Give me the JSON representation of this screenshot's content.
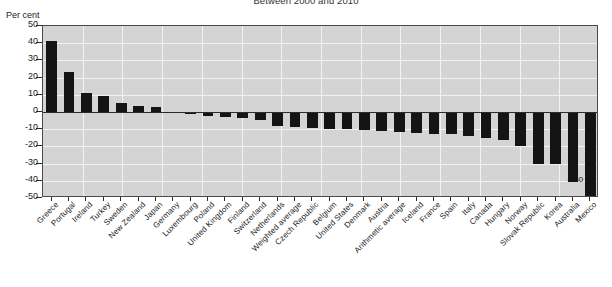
{
  "chart_data": {
    "type": "bar",
    "title": "Between 2000 and 2010",
    "xlabel": "",
    "ylabel": "Per cent",
    "ylim": [
      -50,
      50
    ],
    "yticks": [
      50,
      40,
      30,
      20,
      10,
      0,
      -10,
      -20,
      -30,
      -40,
      -50
    ],
    "ytick_labels": [
      "50",
      "40",
      "30",
      "20",
      "10",
      "0",
      "-10",
      "-20",
      "-30",
      "-40",
      "-50"
    ],
    "grid": true,
    "legend": "none",
    "categories": [
      "Greece",
      "Portugal",
      "Ireland",
      "Turkey",
      "Sweden",
      "New Zealand",
      "Japan",
      "Germany",
      "Luxembourg",
      "Poland",
      "United Kingdom",
      "Finland",
      "Switzerland",
      "Netherlands",
      "Weighted average",
      "Czech Republic",
      "Belgium",
      "United States",
      "Denmark",
      "Austria",
      "Arithmetic average",
      "Iceland",
      "France",
      "Spain",
      "Italy",
      "Canada",
      "Hungary",
      "Norway",
      "Slovak Republic",
      "Korea",
      "Australia",
      "Mexico"
    ],
    "values": [
      41.5,
      23.5,
      11.2,
      9.2,
      5.5,
      3.6,
      2.8,
      -0.5,
      -1.2,
      -2.5,
      -3.0,
      -3.2,
      -4.8,
      -8.0,
      -9.0,
      -9.5,
      -9.8,
      -10.0,
      -10.5,
      -11.0,
      -11.5,
      -12.0,
      -12.5,
      -13.0,
      -14.0,
      -15.0,
      -16.0,
      -19.5,
      -30.0,
      -30.5,
      -40.5,
      -140
    ],
    "annotations": [
      {
        "category": "Mexico",
        "text": "-140"
      }
    ],
    "series_color": "#141414",
    "plot_background": "#d4d4d4",
    "gridline_color": "#f2f2f2"
  }
}
